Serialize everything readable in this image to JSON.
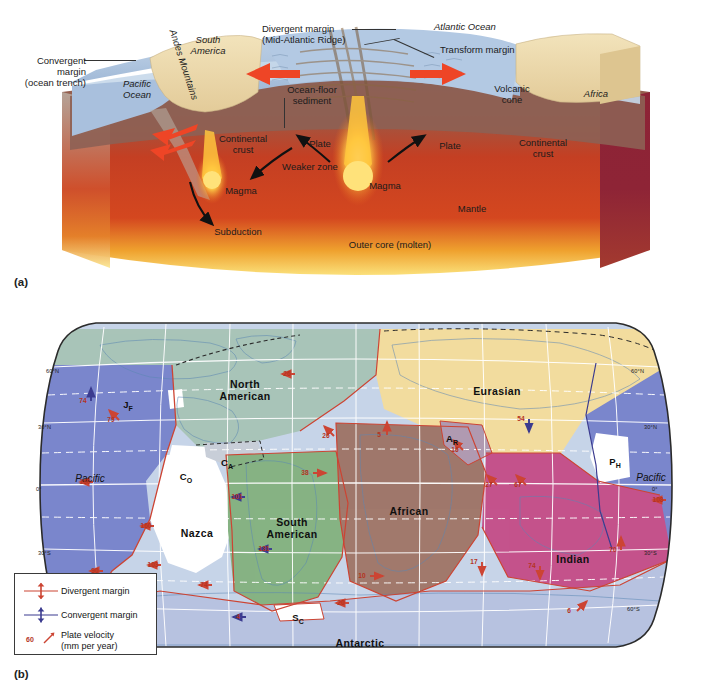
{
  "figure": {
    "panel_a_tag": "(a)",
    "panel_b_tag": "(b)"
  },
  "panel_a": {
    "type": "cross-section-block-diagram",
    "labels": {
      "convergent_margin": "Convergent\nmargin\n(ocean trench)",
      "convergent_margin_l1": "Convergent",
      "convergent_margin_l2": "margin",
      "convergent_margin_l3": "(ocean trench)",
      "pacific_ocean_l1": "Pacific",
      "pacific_ocean_l2": "Ocean",
      "andes": "Andes Mountains",
      "south_america_l1": "South",
      "south_america_l2": "America",
      "divergent_margin_l1": "Divergent margin",
      "divergent_margin_l2": "(Mid-Atlantic Ridge)",
      "atlantic_ocean": "Atlantic Ocean",
      "transform_margin": "Transform margin",
      "ocean_floor_sediment_l1": "Ocean-floor",
      "ocean_floor_sediment_l2": "sediment",
      "volcanic_cone_l1": "Volcanic",
      "volcanic_cone_l2": "cone",
      "africa": "Africa",
      "continental_crust_left_l1": "Continental",
      "continental_crust_left_l2": "crust",
      "continental_crust_right_l1": "Continental",
      "continental_crust_right_l2": "crust",
      "plate_left": "Plate",
      "plate_right": "Plate",
      "weaker_zone": "Weaker zone",
      "magma_left": "Magma",
      "magma_center": "Magma",
      "subduction": "Subduction",
      "mantle": "Mantle",
      "outer_core": "Outer core (molten)"
    },
    "colors": {
      "ocean_water": "#aec4de",
      "continent_tan": "#ecd9a8",
      "mantle_upper": "#8d6154",
      "mantle_red": "#c73a22",
      "outer_core": "#f6d36b",
      "arrow_red": "#e8402a",
      "cut_face": "#8a2236"
    }
  },
  "panel_b": {
    "type": "world-plate-map",
    "legend": {
      "items": [
        {
          "symbol": "divergent-margin-symbol",
          "label": "Divergent margin",
          "color": "#cc4433"
        },
        {
          "symbol": "convergent-margin-symbol",
          "label": "Convergent margin",
          "color": "#3b3b8f"
        },
        {
          "symbol": "plate-velocity-symbol",
          "label_l1": "Plate velocity",
          "label_l2": "(mm per year)",
          "value": "60",
          "color": "#cc4433"
        }
      ]
    },
    "latitude_labels": [
      {
        "text": "60°N",
        "side": "left"
      },
      {
        "text": "30°N",
        "side": "left"
      },
      {
        "text": "0°",
        "side": "left"
      },
      {
        "text": "30°S",
        "side": "left"
      },
      {
        "text": "60°N",
        "side": "right"
      },
      {
        "text": "30°N",
        "side": "right"
      },
      {
        "text": "0°",
        "side": "right"
      },
      {
        "text": "30°S",
        "side": "right"
      },
      {
        "text": "60°S",
        "side": "right"
      }
    ],
    "plates": [
      {
        "name": "North American",
        "abbr": null,
        "fill": "#a9c4b8",
        "x": 245,
        "y": 73,
        "l1": "North",
        "l2": "American"
      },
      {
        "name": "Eurasian",
        "abbr": null,
        "fill": "#f2dc9f",
        "x": 497,
        "y": 80,
        "l1": "Eurasian",
        "l2": ""
      },
      {
        "name": "Pacific (east)",
        "abbr": null,
        "fill": "#7b86cc",
        "x": 90,
        "y": 168,
        "l1": "Pacific",
        "l2": "",
        "ocean": true
      },
      {
        "name": "Pacific (west)",
        "abbr": null,
        "fill": "#7b86cc",
        "x": 651,
        "y": 167,
        "l1": "Pacific",
        "l2": "",
        "ocean": true
      },
      {
        "name": "Nazca",
        "abbr": null,
        "fill": "#ffffff",
        "x": 197,
        "y": 222,
        "l1": "Nazca",
        "l2": ""
      },
      {
        "name": "South American",
        "abbr": null,
        "fill": "#86b383",
        "x": 292,
        "y": 211,
        "l1": "South",
        "l2": "American"
      },
      {
        "name": "African",
        "abbr": null,
        "fill": "#a1796c",
        "x": 409,
        "y": 200,
        "l1": "African",
        "l2": ""
      },
      {
        "name": "Indian",
        "abbr": null,
        "fill": "#c4538c",
        "x": 573,
        "y": 248,
        "l1": "Indian",
        "l2": ""
      },
      {
        "name": "Antarctic",
        "abbr": null,
        "fill": "#b7c2e0",
        "x": 360,
        "y": 332,
        "l1": "Antarctic",
        "l2": ""
      },
      {
        "name": "Juan de Fuca",
        "abbr": "JF",
        "fill": "#ffffff",
        "x": 128,
        "y": 399
      },
      {
        "name": "Cocos",
        "abbr": "CO",
        "fill": "#ffffff",
        "x": 186,
        "y": 471
      },
      {
        "name": "Caribbean",
        "abbr": "CA",
        "fill": "#c9ced9",
        "x": 227,
        "y": 457
      },
      {
        "name": "Scotia",
        "abbr": "SC",
        "fill": "#ffffff",
        "x": 298,
        "y": 612
      },
      {
        "name": "Arabian",
        "abbr": "AR",
        "fill": "#b09ab2",
        "x": 452,
        "y": 433
      },
      {
        "name": "Philippine",
        "abbr": "PH",
        "fill": "#ffffff",
        "x": 615,
        "y": 456
      }
    ],
    "velocities": [
      {
        "value": "74",
        "x": 83,
        "y": 401,
        "dir": "up",
        "kind": "convergent"
      },
      {
        "value": "79",
        "x": 111,
        "y": 420,
        "dir": "upleft",
        "kind": "divergent"
      },
      {
        "value": "26",
        "x": 287,
        "y": 374,
        "dir": "left",
        "kind": "divergent"
      },
      {
        "value": "26",
        "x": 326,
        "y": 436,
        "dir": "upleft",
        "kind": "divergent"
      },
      {
        "value": "5",
        "x": 379,
        "y": 435,
        "dir": "up",
        "kind": "divergent"
      },
      {
        "value": "54",
        "x": 521,
        "y": 419,
        "dir": "down",
        "kind": "convergent"
      },
      {
        "value": "16",
        "x": 455,
        "y": 450,
        "dir": "upleft",
        "kind": "divergent"
      },
      {
        "value": "101",
        "x": 237,
        "y": 497,
        "dir": "left",
        "kind": "convergent"
      },
      {
        "value": "38",
        "x": 305,
        "y": 473,
        "dir": "right",
        "kind": "divergent"
      },
      {
        "value": "160",
        "x": 85,
        "y": 482,
        "dir": "left",
        "kind": "divergent"
      },
      {
        "value": "160",
        "x": 146,
        "y": 526,
        "dir": "left",
        "kind": "divergent"
      },
      {
        "value": "108",
        "x": 658,
        "y": 500,
        "dir": "left",
        "kind": "divergent"
      },
      {
        "value": "27",
        "x": 489,
        "y": 485,
        "dir": "upleft",
        "kind": "divergent"
      },
      {
        "value": "67",
        "x": 518,
        "y": 485,
        "dir": "upleft",
        "kind": "divergent"
      },
      {
        "value": "131",
        "x": 264,
        "y": 549,
        "dir": "left",
        "kind": "convergent"
      },
      {
        "value": "103",
        "x": 153,
        "y": 565,
        "dir": "left",
        "kind": "divergent"
      },
      {
        "value": "10",
        "x": 362,
        "y": 576,
        "dir": "right",
        "kind": "divergent"
      },
      {
        "value": "17",
        "x": 474,
        "y": 562,
        "dir": "down",
        "kind": "divergent"
      },
      {
        "value": "74",
        "x": 532,
        "y": 566,
        "dir": "down",
        "kind": "divergent"
      },
      {
        "value": "70",
        "x": 613,
        "y": 550,
        "dir": "up",
        "kind": "divergent"
      },
      {
        "value": "90",
        "x": 95,
        "y": 571,
        "dir": "left",
        "kind": "divergent"
      },
      {
        "value": "74",
        "x": 204,
        "y": 585,
        "dir": "left",
        "kind": "divergent"
      },
      {
        "value": "20",
        "x": 341,
        "y": 603,
        "dir": "left",
        "kind": "divergent"
      },
      {
        "value": "4",
        "x": 238,
        "y": 617,
        "dir": "left",
        "kind": "convergent"
      },
      {
        "value": "6",
        "x": 569,
        "y": 611,
        "dir": "upright",
        "kind": "divergent"
      }
    ],
    "colors": {
      "divergent": "#cc4433",
      "convergent": "#3b3b8f",
      "graticule": "#ffffff",
      "map_border": "#2b2b2b",
      "velocity_text": "#b4331f"
    }
  }
}
